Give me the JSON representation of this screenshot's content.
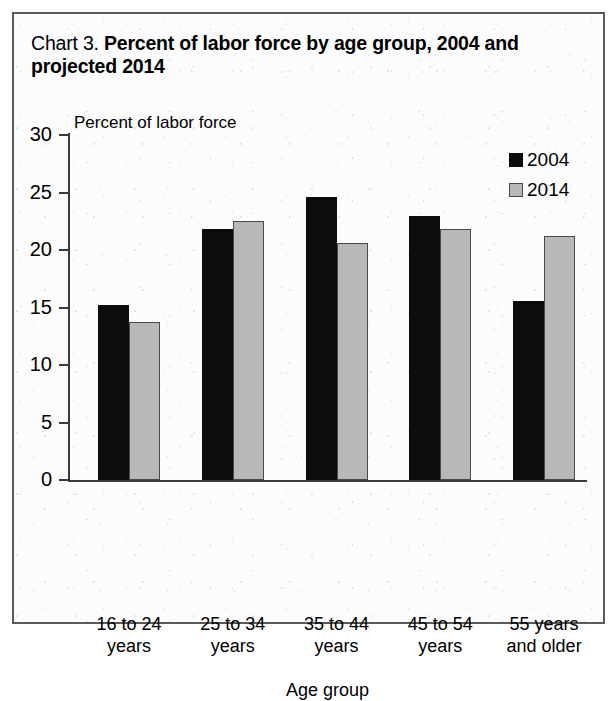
{
  "title": {
    "prefix": "Chart 3.",
    "main": "Percent of labor force by age group, 2004 and projected 2014"
  },
  "colors": {
    "series_2004": "#0d0d0d",
    "series_2014": "#b8b8b8",
    "axis": "#3a3a3a",
    "frame": "#5a5a5a",
    "background": "#fcfcfc"
  },
  "legend": {
    "position": "top-right",
    "entries": [
      {
        "label": "2004",
        "swatch": "black-square-icon"
      },
      {
        "label": "2014",
        "swatch": "gray-square-icon"
      }
    ]
  },
  "chart_data": {
    "type": "bar",
    "title": "Chart 3. Percent of labor force by age group, 2004 and projected 2014",
    "xlabel": "Age group",
    "ylabel": "Percent of labor force",
    "ylim": [
      0,
      30
    ],
    "yticks": [
      0,
      5,
      10,
      15,
      20,
      25,
      30
    ],
    "ytick_labels": [
      "0",
      "5",
      "10",
      "15",
      "20",
      "25",
      "30"
    ],
    "grid": false,
    "legend_position": "top-right",
    "categories": [
      "16 to 24 years",
      "25 to 34 years",
      "35 to 44 years",
      "45 to 54 years",
      "55 years and older"
    ],
    "category_lines": [
      [
        "16 to 24",
        "years"
      ],
      [
        "25 to 34",
        "years"
      ],
      [
        "35 to 44",
        "years"
      ],
      [
        "45 to 54",
        "years"
      ],
      [
        "55 years",
        "and older"
      ]
    ],
    "series": [
      {
        "name": "2004",
        "values": [
          15.2,
          21.8,
          24.6,
          23.0,
          15.6
        ]
      },
      {
        "name": "2014",
        "values": [
          13.7,
          22.5,
          20.6,
          21.8,
          21.2
        ]
      }
    ]
  }
}
